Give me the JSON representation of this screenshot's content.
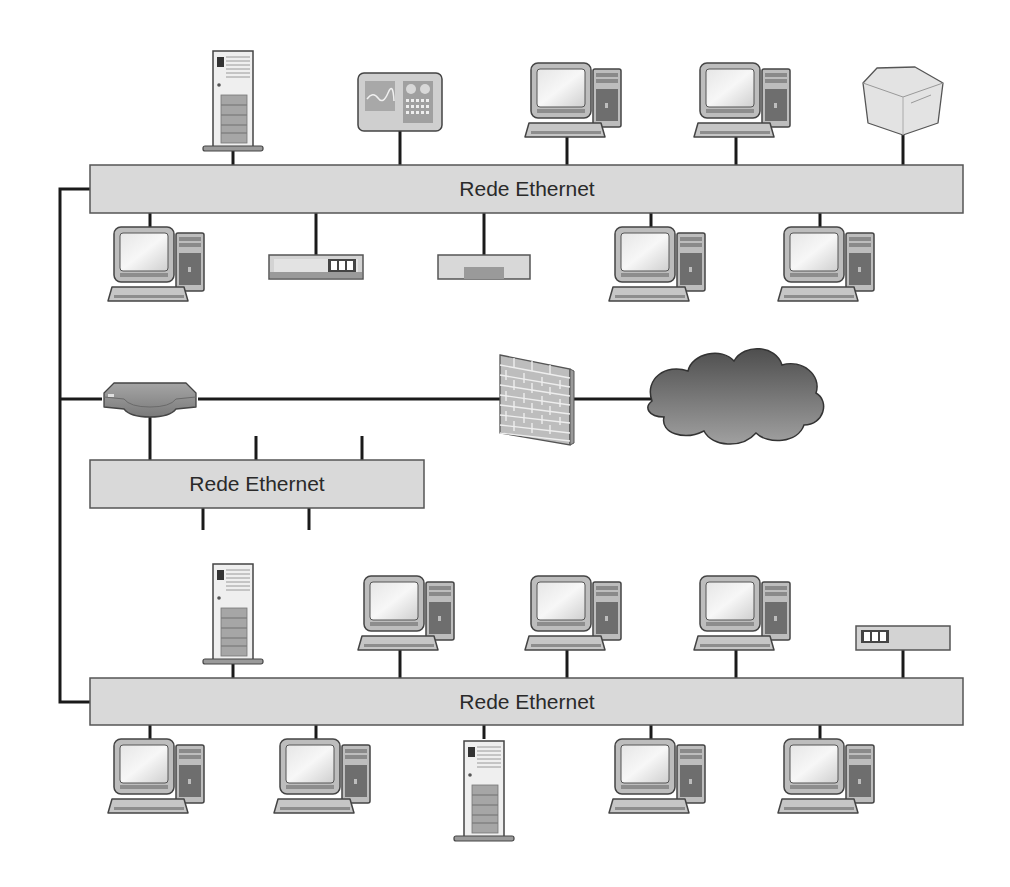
{
  "diagram": {
    "title": "",
    "colors": {
      "background": "#ffffff",
      "bus_fill": "#d9d9d9",
      "bus_stroke": "#555555",
      "wire": "#1a1a1a",
      "device_fill": "#c8c8c8",
      "device_dark": "#8a8a8a",
      "cloud_dark": "#555555",
      "cloud_light": "#9a9a9a"
    },
    "trunk": {
      "x": 60,
      "y_top": 189,
      "y_bottom": 702
    },
    "buses": [
      {
        "id": "bus-top",
        "label": "Rede Ethernet",
        "x": 90,
        "y": 165,
        "w": 873,
        "h": 48,
        "label_x": 527
      },
      {
        "id": "bus-middle",
        "label": "Rede Ethernet",
        "x": 90,
        "y": 460,
        "w": 334,
        "h": 48,
        "label_x": 257
      },
      {
        "id": "bus-bottom",
        "label": "Rede Ethernet",
        "x": 90,
        "y": 678,
        "w": 873,
        "h": 47,
        "label_x": 527
      }
    ],
    "devices": [
      {
        "type": "server",
        "name": "server-top",
        "x": 233,
        "bus": "bus-top",
        "side": "above"
      },
      {
        "type": "monitor-panel",
        "name": "monitoring-panel",
        "x": 400,
        "bus": "bus-top",
        "side": "above"
      },
      {
        "type": "workstation",
        "name": "workstation-top-1",
        "x": 567,
        "bus": "bus-top",
        "side": "above"
      },
      {
        "type": "workstation",
        "name": "workstation-top-2",
        "x": 736,
        "bus": "bus-top",
        "side": "above"
      },
      {
        "type": "printer",
        "name": "printer",
        "x": 903,
        "bus": "bus-top",
        "side": "above"
      },
      {
        "type": "workstation",
        "name": "workstation-top-3",
        "x": 150,
        "bus": "bus-top",
        "side": "below"
      },
      {
        "type": "hub",
        "name": "hub-top",
        "x": 316,
        "bus": "bus-top",
        "side": "below"
      },
      {
        "type": "modem",
        "name": "modem-top",
        "x": 484,
        "bus": "bus-top",
        "side": "below"
      },
      {
        "type": "workstation",
        "name": "workstation-top-4",
        "x": 651,
        "bus": "bus-top",
        "side": "below"
      },
      {
        "type": "workstation",
        "name": "workstation-top-5",
        "x": 820,
        "bus": "bus-top",
        "side": "below"
      },
      {
        "type": "server",
        "name": "server-bottom-1",
        "x": 233,
        "bus": "bus-bottom",
        "side": "above"
      },
      {
        "type": "workstation",
        "name": "workstation-bottom-1",
        "x": 400,
        "bus": "bus-bottom",
        "side": "above"
      },
      {
        "type": "workstation",
        "name": "workstation-bottom-2",
        "x": 567,
        "bus": "bus-bottom",
        "side": "above"
      },
      {
        "type": "workstation",
        "name": "workstation-bottom-3",
        "x": 736,
        "bus": "bus-bottom",
        "side": "above"
      },
      {
        "type": "hub",
        "name": "hub-bottom",
        "x": 903,
        "bus": "bus-bottom",
        "side": "above"
      },
      {
        "type": "workstation",
        "name": "workstation-bottom-4",
        "x": 150,
        "bus": "bus-bottom",
        "side": "below"
      },
      {
        "type": "workstation",
        "name": "workstation-bottom-5",
        "x": 316,
        "bus": "bus-bottom",
        "side": "below"
      },
      {
        "type": "server",
        "name": "server-bottom-2",
        "x": 484,
        "bus": "bus-bottom",
        "side": "below"
      },
      {
        "type": "workstation",
        "name": "workstation-bottom-6",
        "x": 651,
        "bus": "bus-bottom",
        "side": "below"
      },
      {
        "type": "workstation",
        "name": "workstation-bottom-7",
        "x": 820,
        "bus": "bus-bottom",
        "side": "below"
      }
    ],
    "middle_bus_stubs": [
      {
        "x": 256,
        "side": "above"
      },
      {
        "x": 362,
        "side": "above"
      },
      {
        "x": 203,
        "side": "below"
      },
      {
        "x": 309,
        "side": "below"
      }
    ],
    "router": {
      "x": 150,
      "y": 399,
      "w": 96,
      "h": 34
    },
    "firewall": {
      "x": 536,
      "y": 399
    },
    "cloud": {
      "x": 736,
      "y": 397,
      "label": ""
    }
  }
}
